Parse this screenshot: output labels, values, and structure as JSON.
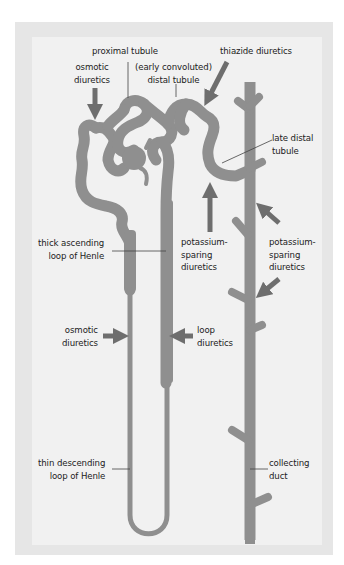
{
  "figure": {
    "type": "nephron diuretic sites of action",
    "colors": {
      "outer_frame": "#e6e6e6",
      "inner_panel": "#f1f1f1",
      "tubule": "#8f8f8f",
      "arrow": "#6e6e6e",
      "label_text": "#222222",
      "leader_line": "#444444"
    }
  },
  "labels": {
    "proximal_tubule": "proximal tubule",
    "osmotic_diuretics_top": "osmotic\ndiuretics",
    "early_distal_tubule": "(early convoluted)\ndistal tubule",
    "thiazide_diuretics": "thiazide diuretics",
    "late_distal_tubule": "late distal\ntubule",
    "thick_ascending": "thick ascending\nloop of Henle",
    "potassium_sparing_left": "potassium-\nsparing\ndiuretics",
    "potassium_sparing_right": "potassium-\nsparing\ndiuretics",
    "osmotic_diuretics_bottom": "osmotic\ndiuretics",
    "loop_diuretics": "loop\ndiuretics",
    "thin_descending": "thin descending\nloop of Henle",
    "collecting_duct": "collecting\nduct"
  },
  "drug_sites": [
    {
      "drug": "osmotic diuretics",
      "site": "proximal tubule"
    },
    {
      "drug": "thiazide diuretics",
      "site": "early distal tubule"
    },
    {
      "drug": "potassium-sparing diuretics",
      "site": "late distal tubule"
    },
    {
      "drug": "potassium-sparing diuretics",
      "site": "collecting duct"
    },
    {
      "drug": "osmotic diuretics",
      "site": "thin descending loop of Henle"
    },
    {
      "drug": "loop diuretics",
      "site": "thick ascending loop of Henle"
    }
  ]
}
